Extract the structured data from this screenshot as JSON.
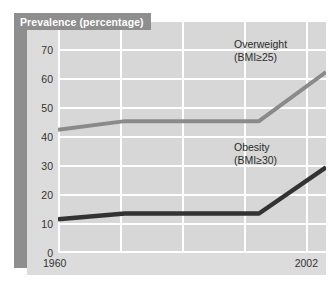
{
  "chart": {
    "title": "Prevalence (percentage)",
    "y_ticks": [
      "70",
      "60",
      "50",
      "40",
      "30",
      "20",
      "10",
      "0"
    ],
    "x_tick_start": "1960",
    "x_tick_end": "2002",
    "series_labels": {
      "overweight_line1": "Overweight",
      "overweight_line2": "(BMI≥25)",
      "obesity_line1": "Obesity",
      "obesity_line2": "(BMI≥30)"
    }
  },
  "chart_data": {
    "type": "line",
    "title": "Prevalence (percentage)",
    "xlabel": "",
    "ylabel": "Prevalence (percentage)",
    "ylim": [
      0,
      70
    ],
    "ytick_values": [
      0,
      10,
      20,
      30,
      40,
      50,
      60,
      70
    ],
    "xtick_labels": [
      "1960",
      "2002"
    ],
    "grid": true,
    "legend_position": "inline-annotation",
    "x": [
      1960,
      1971,
      1978,
      1990,
      2002
    ],
    "series": [
      {
        "name": "Overweight (BMI≥25)",
        "color": "#8a8a8a",
        "values": [
          42,
          45,
          45,
          45,
          62
        ]
      },
      {
        "name": "Obesity (BMI≥30)",
        "color": "#333333",
        "values": [
          11,
          13,
          13,
          13,
          29
        ]
      }
    ],
    "annotations": [
      {
        "text": "Overweight (BMI≥25)",
        "series": "Overweight (BMI≥25)"
      },
      {
        "text": "Obesity (BMI≥30)",
        "series": "Obesity (BMI≥30)"
      }
    ]
  },
  "colors": {
    "overweight": "#8a8a8a",
    "obesity": "#333333",
    "plot_background": "#d7d7d7",
    "panel_background": "#dcdcdc",
    "banner": "#8e8e8e",
    "gridline": "#ffffff"
  }
}
